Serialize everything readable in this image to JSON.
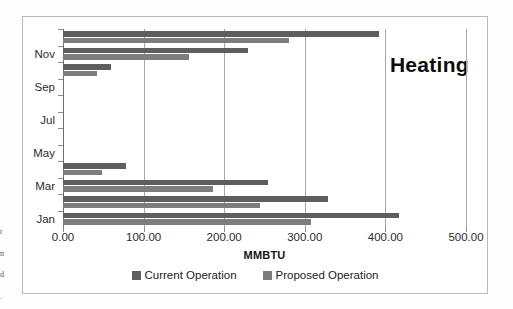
{
  "annotation": "Heating",
  "chart_data": {
    "type": "bar",
    "orientation": "horizontal",
    "title": "Heating",
    "xlabel": "MMBTU",
    "ylabel": "",
    "xlim": [
      0,
      500
    ],
    "xticks": [
      0,
      100,
      200,
      300,
      400,
      500
    ],
    "xtick_labels": [
      "0.00",
      "100.00",
      "200.00",
      "300.00",
      "400.00",
      "500.00"
    ],
    "grid": "vertical",
    "legend_position": "bottom",
    "categories": [
      "Jan",
      "Feb",
      "Mar",
      "Apr",
      "May",
      "Jun",
      "Jul",
      "Aug",
      "Sep",
      "Oct",
      "Nov",
      "Dec"
    ],
    "visible_category_labels": [
      "Jan",
      "Mar",
      "May",
      "Jul",
      "Sep",
      "Nov"
    ],
    "series": [
      {
        "name": "Current Operation",
        "color": "#5e5e5e",
        "values": [
          417,
          329,
          254,
          78,
          0,
          0,
          0,
          0,
          0,
          60,
          229,
          392
        ]
      },
      {
        "name": "Proposed Operation",
        "color": "#7d7d7d",
        "values": [
          308,
          244,
          186,
          49,
          0,
          0,
          0,
          0,
          0,
          42,
          156,
          280
        ]
      }
    ]
  },
  "edge_scraps": [
    "r",
    "n",
    "d",
    "."
  ]
}
